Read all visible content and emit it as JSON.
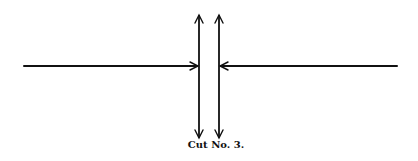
{
  "diagram": {
    "caption": "Cut No. 3.",
    "colors": {
      "ink": "#111111",
      "background": "#ffffff"
    },
    "elements": [
      {
        "type": "arrow",
        "name": "left-horizontal-arrow",
        "from": [
          24,
          66
        ],
        "to": [
          198,
          66
        ],
        "head": "end"
      },
      {
        "type": "arrow",
        "name": "right-horizontal-arrow",
        "from": [
          397,
          66
        ],
        "to": [
          220,
          66
        ],
        "head": "end"
      },
      {
        "type": "double-arrow",
        "name": "left-vertical-arrow",
        "x": 199,
        "y1": 15,
        "y2": 137
      },
      {
        "type": "double-arrow",
        "name": "right-vertical-arrow",
        "x": 219,
        "y1": 15,
        "y2": 137
      }
    ]
  }
}
